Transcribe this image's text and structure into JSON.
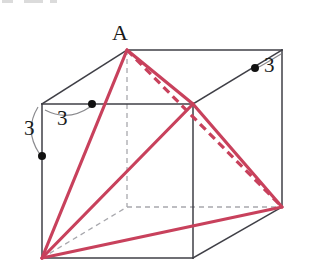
{
  "figure": {
    "kind": "3d-cube-geometry-diagram",
    "canvas": {
      "width": 311,
      "height": 275
    },
    "colors": {
      "background": "#ffffff",
      "edge_solid": "#3f3f46",
      "edge_hidden": "#a8a8ad",
      "accent_red": "#c8415c",
      "accent_red_dashed": "#c8415c",
      "marker_dot": "#111111",
      "arc_guide": "#8b8b8f",
      "label_text": "#1a1a1a"
    },
    "labels": [
      {
        "name": "vertex-label-A",
        "text": "A",
        "x": 112,
        "y": 22,
        "size": 22
      },
      {
        "name": "length-label-right",
        "text": "3",
        "x": 264,
        "y": 55,
        "size": 21
      },
      {
        "name": "length-label-top",
        "text": "3",
        "x": 57,
        "y": 108,
        "size": 21
      },
      {
        "name": "length-label-left",
        "text": "3",
        "x": 24,
        "y": 118,
        "size": 21
      }
    ],
    "vertices": {
      "front_top_left": [
        42,
        104
      ],
      "front_top_right": [
        193,
        104
      ],
      "front_bottom_right": [
        193,
        258
      ],
      "front_bottom_left": [
        42,
        258
      ],
      "back_top_left": [
        127,
        50
      ],
      "back_top_right": [
        282,
        50
      ],
      "back_bottom_right": [
        282,
        207
      ],
      "back_bottom_left": [
        127,
        207
      ]
    },
    "apex_vertex": "back_top_left",
    "solid_edges": [
      "front_top_left->front_top_right",
      "front_top_right->front_bottom_right",
      "front_bottom_right->front_bottom_left",
      "front_bottom_left->front_top_left",
      "back_top_left->back_top_right",
      "back_top_right->back_bottom_right",
      "front_top_left->back_top_left",
      "front_top_right->back_top_right",
      "front_bottom_right->back_bottom_right"
    ],
    "hidden_edges": [
      "back_top_left->back_bottom_left",
      "back_bottom_left->back_bottom_right",
      "front_bottom_left->back_bottom_left"
    ],
    "red_solid_segments": [
      "front_bottom_left->back_top_left",
      "front_bottom_left->front_top_right",
      "front_bottom_left->back_bottom_right",
      "back_top_left->front_top_right",
      "front_top_right->back_bottom_right"
    ],
    "red_dashed_segments": [
      "back_top_left->back_bottom_right"
    ],
    "markers": [
      {
        "name": "midpoint-dot-top-edge",
        "x": 92,
        "y": 104
      },
      {
        "name": "midpoint-dot-left-edge",
        "x": 42,
        "y": 156
      },
      {
        "name": "midpoint-dot-right-edge",
        "x": 255,
        "y": 68
      }
    ],
    "measure_arcs": [
      {
        "name": "arc-top-edge",
        "from": [
          44,
          106
        ],
        "to": [
          90,
          102
        ],
        "label": "3"
      },
      {
        "name": "arc-left-edge",
        "from": [
          40,
          106
        ],
        "to": [
          41,
          154
        ],
        "label": "3"
      },
      {
        "name": "arc-right-edge",
        "from": [
          282,
          53
        ],
        "to": [
          257,
          67
        ],
        "label": "3"
      }
    ],
    "measurements": {
      "edge_length": "3",
      "unit": ""
    }
  }
}
